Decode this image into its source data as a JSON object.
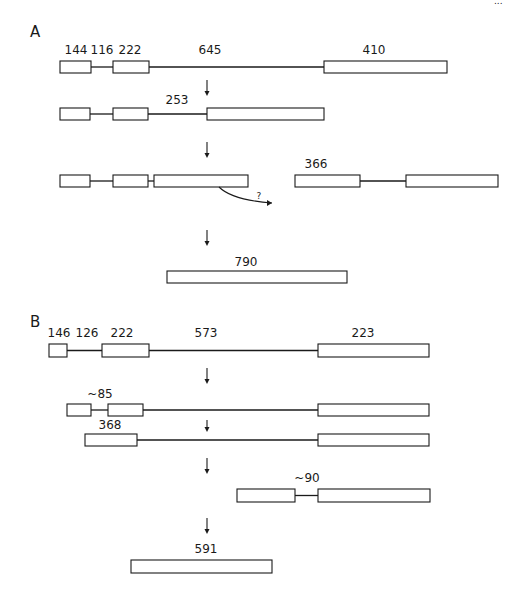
{
  "figure": {
    "page_mark": "...",
    "panels": [
      {
        "id": "A",
        "label": "A",
        "label_pos": [
          30,
          37
        ],
        "rows": [
          {
            "name": "precursor-a",
            "y": 61,
            "h": 12,
            "exons": [
              [
                60,
                91
              ],
              [
                113,
                149
              ],
              [
                324,
                447
              ]
            ],
            "introns": [
              [
                91,
                113
              ],
              [
                149,
                324
              ]
            ],
            "labels": [
              {
                "text": "144",
                "x": 76,
                "y": 54
              },
              {
                "text": "116",
                "x": 102,
                "y": 54
              },
              {
                "text": "222",
                "x": 130,
                "y": 54
              },
              {
                "text": "645",
                "x": 210,
                "y": 54
              },
              {
                "text": "410",
                "x": 374,
                "y": 54
              }
            ]
          },
          {
            "name": "intermediate-a1",
            "y": 108,
            "h": 12,
            "exons": [
              [
                60,
                90
              ],
              [
                113,
                148
              ],
              [
                207,
                324
              ]
            ],
            "introns": [
              [
                90,
                113
              ],
              [
                148,
                207
              ]
            ],
            "labels": [
              {
                "text": "253",
                "x": 177,
                "y": 104
              }
            ]
          },
          {
            "name": "intermediate-a2",
            "y": 175,
            "h": 12,
            "exons": [
              [
                60,
                90
              ],
              [
                113,
                148
              ],
              [
                154,
                248
              ],
              [
                295,
                360
              ],
              [
                406,
                498
              ]
            ],
            "introns": [
              [
                90,
                113
              ],
              [
                148,
                154
              ],
              [
                360,
                406
              ]
            ],
            "labels": [
              {
                "text": "366",
                "x": 316,
                "y": 168
              },
              {
                "text": "?",
                "x": 259,
                "y": 199,
                "cls": "q"
              }
            ]
          },
          {
            "name": "mature-a",
            "y": 271,
            "h": 12,
            "exons": [
              [
                167,
                347
              ]
            ],
            "introns": [],
            "labels": [
              {
                "text": "790",
                "x": 246,
                "y": 266
              }
            ]
          }
        ],
        "arrows": [
          {
            "x": 207,
            "y1": 80,
            "y2": 96
          },
          {
            "x": 207,
            "y1": 142,
            "y2": 158
          },
          {
            "x": 207,
            "y1": 230,
            "y2": 246
          }
        ],
        "curve": {
          "d": "M 219 187 Q 232 200 272 203",
          "head": [
            272,
            203
          ]
        }
      },
      {
        "id": "B",
        "label": "B",
        "label_pos": [
          30,
          327
        ],
        "rows": [
          {
            "name": "precursor-b",
            "y": 344,
            "h": 13,
            "exons": [
              [
                49,
                67
              ],
              [
                102,
                149
              ],
              [
                318,
                429
              ]
            ],
            "introns": [
              [
                67,
                102
              ],
              [
                149,
                318
              ]
            ],
            "labels": [
              {
                "text": "146",
                "x": 59,
                "y": 337
              },
              {
                "text": "126",
                "x": 87,
                "y": 337
              },
              {
                "text": "222",
                "x": 122,
                "y": 337
              },
              {
                "text": "573",
                "x": 206,
                "y": 337
              },
              {
                "text": "223",
                "x": 363,
                "y": 337
              }
            ]
          },
          {
            "name": "intermediate-b1",
            "y": 404,
            "h": 12,
            "exons": [
              [
                67,
                91
              ],
              [
                108,
                143
              ],
              [
                318,
                429
              ]
            ],
            "introns": [
              [
                91,
                108
              ],
              [
                143,
                318
              ]
            ],
            "labels": [
              {
                "text": "~85",
                "x": 100,
                "y": 398
              }
            ]
          },
          {
            "name": "intermediate-b2",
            "y": 434,
            "h": 12,
            "exons": [
              [
                85,
                137
              ],
              [
                318,
                429
              ]
            ],
            "introns": [
              [
                137,
                318
              ]
            ],
            "labels": [
              {
                "text": "368",
                "x": 110,
                "y": 429
              }
            ]
          },
          {
            "name": "intermediate-b3",
            "y": 489,
            "h": 13,
            "exons": [
              [
                237,
                295
              ],
              [
                318,
                430
              ]
            ],
            "introns": [
              [
                295,
                318
              ]
            ],
            "labels": [
              {
                "text": "~90",
                "x": 307,
                "y": 482
              }
            ]
          },
          {
            "name": "mature-b",
            "y": 560,
            "h": 13,
            "exons": [
              [
                131,
                272
              ]
            ],
            "introns": [],
            "labels": [
              {
                "text": "591",
                "x": 206,
                "y": 553
              }
            ]
          }
        ],
        "arrows": [
          {
            "x": 207,
            "y1": 368,
            "y2": 384
          },
          {
            "x": 207,
            "y1": 420,
            "y2": 432
          },
          {
            "x": 207,
            "y1": 458,
            "y2": 474
          },
          {
            "x": 207,
            "y1": 518,
            "y2": 534
          }
        ]
      }
    ]
  }
}
